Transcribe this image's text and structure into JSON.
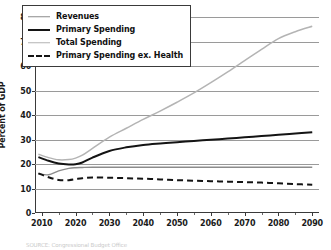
{
  "chart_data": {
    "type": "line",
    "title": "",
    "xlabel": "",
    "ylabel": "Percent of GDP",
    "xlim": [
      2008,
      2092
    ],
    "ylim": [
      0,
      80
    ],
    "grid": true,
    "legend_position": "upper-left-inside",
    "ytick_labels": [
      "0",
      "10",
      "20",
      "30",
      "40",
      "50",
      "60",
      "70",
      "80"
    ],
    "ytick_values": [
      0,
      10,
      20,
      30,
      40,
      50,
      60,
      70,
      80
    ],
    "xtick_labels": [
      "2010",
      "2020",
      "2030",
      "2040",
      "2050",
      "2060",
      "2070",
      "2080",
      "2090"
    ],
    "xtick_values": [
      2010,
      2020,
      2030,
      2040,
      2050,
      2060,
      2070,
      2080,
      2090
    ],
    "xminor_values": [
      2015,
      2025,
      2035,
      2045,
      2055,
      2065,
      2075,
      2085
    ],
    "x": [
      2009,
      2012,
      2015,
      2018,
      2020,
      2022,
      2025,
      2030,
      2035,
      2040,
      2045,
      2050,
      2055,
      2060,
      2065,
      2070,
      2075,
      2080,
      2085,
      2090
    ],
    "series": [
      {
        "name": "Revenues",
        "color": "#8c8c8c",
        "style": "solid",
        "width": 1.4,
        "values": [
          16.0,
          15.6,
          17.2,
          18.2,
          18.5,
          18.6,
          18.7,
          18.7,
          18.7,
          18.7,
          18.7,
          18.7,
          18.7,
          18.7,
          18.7,
          18.7,
          18.7,
          18.7,
          18.7,
          18.7
        ]
      },
      {
        "name": "Primary Spending",
        "color": "#141414",
        "style": "solid",
        "width": 2.0,
        "values": [
          22.8,
          21.3,
          20.2,
          19.8,
          19.9,
          20.6,
          22.6,
          25.3,
          26.8,
          27.8,
          28.4,
          28.9,
          29.4,
          29.9,
          30.4,
          30.9,
          31.4,
          31.9,
          32.4,
          33.0
        ]
      },
      {
        "name": "Total Spending",
        "color": "#b4b4b4",
        "style": "solid",
        "width": 1.5,
        "values": [
          24.0,
          22.6,
          21.7,
          21.8,
          22.4,
          23.6,
          26.4,
          31.0,
          34.6,
          38.2,
          41.6,
          45.2,
          49.0,
          53.2,
          57.6,
          62.2,
          66.8,
          71.2,
          74.0,
          76.2
        ]
      },
      {
        "name": "Primary Spending ex. Health",
        "color": "#141414",
        "style": "dashed",
        "width": 2.0,
        "values": [
          16.2,
          14.6,
          13.5,
          13.4,
          13.8,
          14.2,
          14.5,
          14.4,
          14.2,
          14.0,
          13.7,
          13.4,
          13.2,
          13.0,
          12.8,
          12.6,
          12.4,
          12.1,
          11.8,
          11.5
        ]
      }
    ]
  },
  "legend": {
    "items": [
      {
        "label": "Revenues"
      },
      {
        "label": "Primary Spending"
      },
      {
        "label": "Total Spending"
      },
      {
        "label": "Primary Spending ex. Health"
      }
    ]
  },
  "source": {
    "text": "SOURCE: Congressional Budget Office"
  }
}
